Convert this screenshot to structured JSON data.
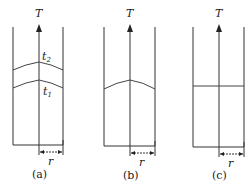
{
  "figure": {
    "axis_label": "T",
    "radius_label": "r",
    "panels": [
      {
        "id": "a",
        "caption": "(a)",
        "curves": [
          {
            "label": "t",
            "subscript": "2"
          },
          {
            "label": "t",
            "subscript": "1"
          }
        ]
      },
      {
        "id": "b",
        "caption": "(b)"
      },
      {
        "id": "c",
        "caption": "(c)"
      }
    ]
  }
}
